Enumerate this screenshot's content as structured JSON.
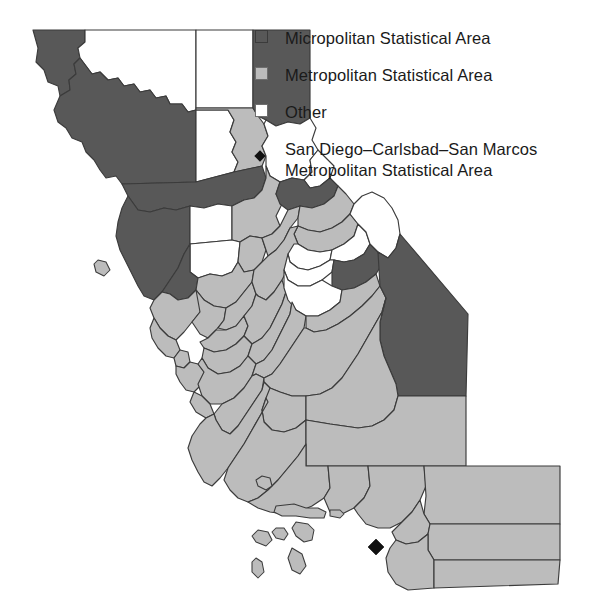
{
  "figure": {
    "background_color": "#ffffff",
    "width": 597,
    "height": 610
  },
  "legend": {
    "items": [
      {
        "id": "micropolitan",
        "symbol": "filled-square",
        "color": "#585858",
        "label": "Micropolitan Statistical Area"
      },
      {
        "id": "metropolitan",
        "symbol": "filled-square",
        "color": "#bcbcbc",
        "label": "Metropolitan Statistical Area"
      },
      {
        "id": "other",
        "symbol": "empty-square",
        "color": "#ffffff",
        "label": "Other"
      },
      {
        "id": "san-diego-marker",
        "symbol": "filled-diamond",
        "color": "#111111",
        "label_line1": "San Diego–Carlsbad–San Marcos",
        "label_line2": "Metropolitan Statistical Area"
      }
    ]
  },
  "chart_data": {
    "type": "map",
    "title": "",
    "region": "California",
    "classification_field": "statistical_area_type",
    "categories": [
      "Micropolitan Statistical Area",
      "Metropolitan Statistical Area",
      "Other"
    ],
    "category_colors": {
      "Micropolitan Statistical Area": "#585858",
      "Metropolitan Statistical Area": "#bcbcbc",
      "Other": "#ffffff"
    },
    "markers": [
      {
        "name": "San Diego–Carlsbad–San Marcos Metropolitan Statistical Area",
        "symbol": "filled-diamond",
        "color": "#111111",
        "x": 376,
        "y": 547
      }
    ],
    "counts": {
      "Micropolitan Statistical Area": 13,
      "Metropolitan Statistical Area": 31,
      "Other": 14
    },
    "features": [
      {
        "name": "Del Norte",
        "class": "micro"
      },
      {
        "name": "Siskiyou",
        "class": "other"
      },
      {
        "name": "Modoc",
        "class": "other"
      },
      {
        "name": "Humboldt",
        "class": "micro"
      },
      {
        "name": "Trinity",
        "class": "other"
      },
      {
        "name": "Shasta",
        "class": "metro"
      },
      {
        "name": "Lassen",
        "class": "micro"
      },
      {
        "name": "Tehama",
        "class": "micro"
      },
      {
        "name": "Plumas",
        "class": "other"
      },
      {
        "name": "Mendocino",
        "class": "micro"
      },
      {
        "name": "Glenn",
        "class": "other"
      },
      {
        "name": "Butte",
        "class": "metro"
      },
      {
        "name": "Sierra",
        "class": "other"
      },
      {
        "name": "Nevada",
        "class": "micro"
      },
      {
        "name": "Colusa",
        "class": "other"
      },
      {
        "name": "Sutter",
        "class": "metro"
      },
      {
        "name": "Yuba",
        "class": "metro"
      },
      {
        "name": "Placer",
        "class": "metro"
      },
      {
        "name": "Lake",
        "class": "micro"
      },
      {
        "name": "Yolo",
        "class": "metro"
      },
      {
        "name": "El Dorado",
        "class": "metro"
      },
      {
        "name": "Sonoma",
        "class": "metro"
      },
      {
        "name": "Napa",
        "class": "metro"
      },
      {
        "name": "Solano",
        "class": "metro"
      },
      {
        "name": "Sacramento",
        "class": "metro"
      },
      {
        "name": "Amador",
        "class": "other"
      },
      {
        "name": "Alpine",
        "class": "other"
      },
      {
        "name": "Marin",
        "class": "metro"
      },
      {
        "name": "Contra Costa",
        "class": "metro"
      },
      {
        "name": "San Joaquin",
        "class": "metro"
      },
      {
        "name": "Calaveras",
        "class": "other"
      },
      {
        "name": "Tuolumne",
        "class": "micro"
      },
      {
        "name": "Mono",
        "class": "other"
      },
      {
        "name": "San Francisco",
        "class": "metro"
      },
      {
        "name": "Alameda",
        "class": "metro"
      },
      {
        "name": "Stanislaus",
        "class": "metro"
      },
      {
        "name": "Mariposa",
        "class": "other"
      },
      {
        "name": "San Mateo",
        "class": "metro"
      },
      {
        "name": "Santa Clara",
        "class": "metro"
      },
      {
        "name": "Merced",
        "class": "metro"
      },
      {
        "name": "Madera",
        "class": "metro"
      },
      {
        "name": "Santa Cruz",
        "class": "metro"
      },
      {
        "name": "San Benito",
        "class": "metro"
      },
      {
        "name": "Fresno",
        "class": "metro"
      },
      {
        "name": "Inyo",
        "class": "micro"
      },
      {
        "name": "Monterey",
        "class": "metro"
      },
      {
        "name": "Kings",
        "class": "metro"
      },
      {
        "name": "Tulare",
        "class": "metro"
      },
      {
        "name": "San Luis Obispo",
        "class": "metro"
      },
      {
        "name": "Kern",
        "class": "metro"
      },
      {
        "name": "Santa Barbara",
        "class": "metro"
      },
      {
        "name": "Ventura",
        "class": "metro"
      },
      {
        "name": "Los Angeles",
        "class": "metro"
      },
      {
        "name": "San Bernardino",
        "class": "metro"
      },
      {
        "name": "Orange",
        "class": "metro"
      },
      {
        "name": "Riverside",
        "class": "metro"
      },
      {
        "name": "San Diego",
        "class": "metro"
      },
      {
        "name": "Imperial",
        "class": "metro"
      }
    ]
  }
}
